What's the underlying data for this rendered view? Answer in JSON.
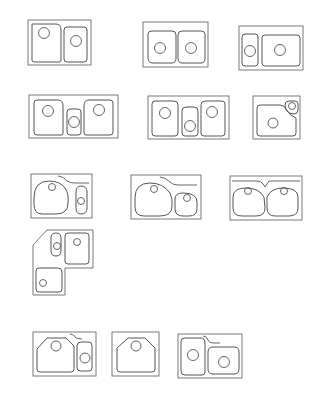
{
  "figure": {
    "type": "sink-configuration-line-drawings",
    "colors": {
      "background": "#ffffff",
      "line": "#555555",
      "frame": "#6a6a6a"
    },
    "sinks": [
      {
        "id": "sink-1",
        "label": "double-bowl-large-left",
        "frame": [
          28,
          20,
          63,
          45
        ],
        "basins": [
          "M32,24 L56,24 Q61,24 61,30 L61,60 Q61,62 59,62 L34,62 Q32,62 32,60 Z",
          "M64,30 Q64,27 67,27 L84,27 Q87,27 87,30 L87,59 Q87,62 84,62 L67,62 Q64,62 64,59 Z"
        ],
        "drains": [
          [
            44,
            33,
            5.5
          ],
          [
            76,
            41,
            5.5
          ]
        ],
        "ledges": []
      },
      {
        "id": "sink-2",
        "label": "double-bowl-equal",
        "frame": [
          143,
          22,
          65,
          45
        ],
        "basins": [
          "M148,34 Q148,31 152,31 L172,31 Q176,31 176,35 L176,58 Q176,63 172,63 L153,63 Q148,63 148,58 Z",
          "M178,35 Q178,31 182,31 L201,31 Q205,31 205,34 L205,58 Q205,63 201,63 L182,63 Q178,63 178,58 Z"
        ],
        "drains": [
          [
            160,
            48,
            5.5
          ],
          [
            191,
            48,
            5.5
          ]
        ],
        "ledges": []
      },
      {
        "id": "sink-3",
        "label": "double-bowl-small-left",
        "frame": [
          239,
          26,
          64,
          44
        ],
        "basins": [
          "M242,37 Q242,34 245,34 L255,34 Q258,34 258,37 L258,63 Q258,66 255,66 L245,66 Q242,66 242,63 Z",
          "M262,38 Q262,35 265,35 L297,35 Q300,35 300,38 L300,63 Q300,66 297,66 L265,66 Q262,66 262,63 Z"
        ],
        "drains": [
          [
            250,
            51,
            5.5
          ],
          [
            280,
            50,
            5.5
          ]
        ],
        "ledges": []
      },
      {
        "id": "sink-4",
        "label": "triple-bowl-small-center",
        "frame": [
          29,
          95,
          89,
          43
        ],
        "basins": [
          "M34,103 Q34,100 37,100 L58,100 Q63,100 63,106 L63,133 Q63,135 61,135 L37,135 Q34,135 34,132 Z",
          "M67,112 Q67,109 70,109 L78,109 Q81,109 81,112 L81,132 Q81,135 78,135 L70,135 Q67,135 67,132 Z",
          "M84,106 Q84,100 89,100 L110,100 Q113,100 113,103 L113,132 Q113,135 110,135 L86,135 Q84,135 84,133 Z"
        ],
        "drains": [
          [
            48,
            111,
            5.5
          ],
          [
            74,
            122,
            5.5
          ],
          [
            99,
            110,
            5.5
          ]
        ],
        "ledges": []
      },
      {
        "id": "sink-5",
        "label": "triple-bowl-tall-center",
        "frame": [
          148,
          96,
          81,
          43
        ],
        "basins": [
          "M152,104 Q152,101 155,101 L174,101 Q178,101 178,105 L178,133 Q178,136 175,136 L155,136 Q152,136 152,133 Z",
          "M182,111 Q182,107 186,107 L194,107 Q198,107 198,111 L198,133 Q198,136 195,136 L185,136 Q182,136 182,133 Z",
          "M201,105 Q201,101 205,101 L222,101 Q225,101 225,104 L225,133 Q225,136 222,136 L204,136 Q201,136 201,133 Z"
        ],
        "drains": [
          [
            165,
            113,
            5.5
          ],
          [
            190,
            126,
            5.5
          ],
          [
            212,
            112,
            5.5
          ]
        ],
        "ledges": []
      },
      {
        "id": "sink-6",
        "label": "single-bowl-with-corner-prep",
        "frame": [
          253,
          96,
          47,
          43
        ],
        "basins": [
          "M257,108 Q257,105 260,105 L280,105 Q284,105 286,109 Q290,116 296,118 L296,133 Q296,136 293,136 L260,136 Q257,136 257,133 Z",
          "M285,105 Q285,101 289,101 L295,101 Q298,101 298,104 L298,110 Q298,114 294,114 Q288,114 286,110 Z"
        ],
        "drains": [
          [
            273,
            123,
            5
          ],
          [
            292,
            106,
            3.5
          ]
        ],
        "ledges": []
      },
      {
        "id": "sink-7",
        "label": "round-bowl-with-oval-prep",
        "frame": [
          31,
          174,
          61,
          44
        ],
        "basins": [
          "M34,198 Q34,181 49,181 Q60,181 65,188 Q69,194 68,203 Q68,214 56,214 L42,214 Q34,214 34,204 Z",
          "M76,192 Q76,186 81,186 Q87,186 87,192 L87,208 Q87,214 81,214 Q76,214 76,208 Z"
        ],
        "drains": [
          [
            52,
            187,
            3.5
          ],
          [
            81,
            201,
            3.5
          ]
        ],
        "ledges": [
          "M58,176 Q63,176 67,181 Q70,183 75,183 L89,183"
        ]
      },
      {
        "id": "sink-8",
        "label": "round-bowl-with-small-round",
        "frame": [
          131,
          175,
          70,
          44
        ],
        "basins": [
          "M135,198 Q135,183 150,183 Q163,183 170,193 Q173,199 172,206 Q172,216 160,216 L144,216 Q135,216 135,207 Z",
          "M175,199 Q175,193 183,193 Q197,193 197,202 L197,209 Q197,216 189,216 L183,216 Q175,216 175,209 Z"
        ],
        "drains": [
          [
            154,
            189,
            3.5
          ],
          [
            187,
            198,
            3.5
          ]
        ],
        "ledges": [
          "M160,177 Q165,177 170,182 Q173,185 178,185 L197,185"
        ]
      },
      {
        "id": "sink-9",
        "label": "double-round-bowl-with-ledge",
        "frame": [
          230,
          176,
          72,
          44
        ],
        "basins": [
          "M233,197 Q233,188 246,188 Q259,188 264,197 L265,208 Q265,216 256,216 L242,216 Q233,216 233,208 Z",
          "M267,197 Q271,188 283,188 Q298,188 298,197 L298,208 Q298,216 289,216 L275,216 Q267,216 267,208 Z"
        ],
        "drains": [
          [
            248,
            191,
            3.5
          ],
          [
            284,
            191,
            3.5
          ]
        ],
        "ledges": [
          "M232,181 L258,181 Q261,181 263,184 L265,187 Q267,184 269,181 L272,181 L300,181"
        ]
      },
      {
        "id": "sink-10",
        "label": "corner-l-shape-three-bowl",
        "frame_path": "M47,230 L93,230 L93,268 L65,268 L65,295 L33,295 L33,245 Z",
        "basins": [
          "M51,238 Q51,233 56,233 Q61,233 61,238 L61,251 Q61,256 56,256 Q51,256 51,251 Z",
          "M65,236 Q65,233 68,233 L86,233 Q89,233 89,236 L89,261 Q89,264 86,264 L68,264 Q65,264 65,261 Z",
          "M36,271 Q36,268 39,268 L58,268 Q62,268 62,272 L62,289 Q62,292 59,292 L39,292 Q36,292 36,289 Z"
        ],
        "drains": [
          [
            57,
            246,
            3.5
          ],
          [
            77,
            242,
            3.5
          ],
          [
            43,
            283,
            3.5
          ]
        ],
        "ledges": []
      },
      {
        "id": "sink-11",
        "label": "angled-bowl-with-oval-prep",
        "frame": [
          33,
          332,
          63,
          44
        ],
        "basins": [
          "M37,349 L47,338 L66,338 L74,346 L74,369 Q74,372 71,372 L40,372 Q37,372 37,369 Z",
          "M77,346 Q77,342 81,342 L89,342 Q92,342 92,346 L92,368 Q92,371 89,371 L81,371 Q77,371 77,368 Z"
        ],
        "drains": [
          [
            56,
            346,
            5
          ],
          [
            85,
            358,
            5
          ]
        ],
        "ledges": [
          "M70,334 Q74,334 76,338 L82,339"
        ]
      },
      {
        "id": "sink-12",
        "label": "single-angled-bowl",
        "frame": [
          112,
          332,
          47,
          44
        ],
        "basins": [
          "M117,348 L128,338 L145,338 L155,348 L155,369 Q155,372 152,372 L120,372 Q117,372 117,369 Z"
        ],
        "drains": [
          [
            136,
            346,
            5
          ]
        ],
        "ledges": []
      },
      {
        "id": "sink-13",
        "label": "double-bowl-offset-with-ledge",
        "frame": [
          178,
          334,
          64,
          44
        ],
        "basins": [
          "M181,341 Q181,338 185,338 L201,338 Q205,338 205,343 L205,372 Q205,375 202,375 L185,375 Q181,375 181,371 Z",
          "M208,352 Q208,347 213,347 L234,347 Q239,347 239,352 L239,369 Q239,374 234,374 L213,374 Q208,374 208,369 Z"
        ],
        "drains": [
          [
            193,
            355,
            5.5
          ],
          [
            224,
            362,
            5.5
          ]
        ],
        "ledges": [
          "M203,336 Q207,336 208,340 Q209,343 213,343 L220,343"
        ]
      }
    ]
  }
}
